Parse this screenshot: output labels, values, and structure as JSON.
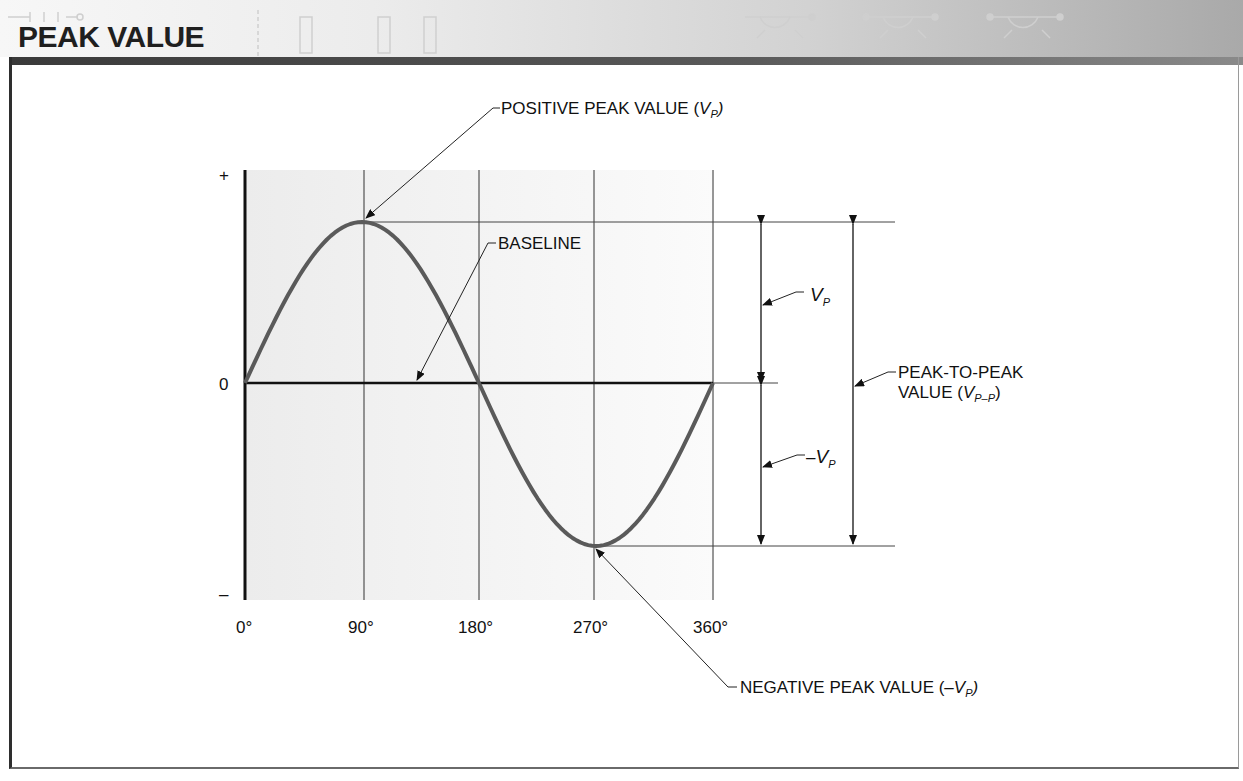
{
  "header": {
    "title": "PEAK VALUE"
  },
  "diagram": {
    "y_axis": {
      "plus_label": "+",
      "zero_label": "0",
      "minus_label": "–"
    },
    "x_axis": {
      "ticks": [
        "0°",
        "90°",
        "180°",
        "270°",
        "360°"
      ]
    },
    "labels": {
      "positive_peak": "POSITIVE PEAK VALUE (",
      "positive_peak_v": "V",
      "positive_peak_sub": "P",
      "positive_peak_close": ")",
      "baseline": "BASELINE",
      "vp_v": "V",
      "vp_sub": "P",
      "neg_vp_prefix": "–",
      "neg_vp_v": "V",
      "neg_vp_sub": "P",
      "p2p_line1": "PEAK-TO-PEAK",
      "p2p_line2": "VALUE (",
      "p2p_v": "V",
      "p2p_sub": "P–P",
      "p2p_close": ")",
      "negative_peak": "NEGATIVE PEAK VALUE (–",
      "negative_peak_v": "V",
      "negative_peak_sub": "P",
      "negative_peak_close": ")"
    },
    "colors": {
      "waveform": "#5a5a5a",
      "lines": "#222222",
      "shading": "#f2f2f2"
    }
  },
  "chart_data": {
    "type": "line",
    "title": "PEAK VALUE",
    "xlabel": "Phase angle",
    "ylabel": "",
    "x": [
      0,
      45,
      90,
      135,
      180,
      225,
      270,
      315,
      360
    ],
    "series": [
      {
        "name": "Sine wave",
        "values": [
          0,
          0.707,
          1,
          0.707,
          0,
          -0.707,
          -1,
          -0.707,
          0
        ]
      }
    ],
    "x_tick_labels": [
      "0°",
      "90°",
      "180°",
      "270°",
      "360°"
    ],
    "y_tick_labels": [
      "+",
      "0",
      "–"
    ],
    "annotations": [
      "POSITIVE PEAK VALUE (VP) at 90°",
      "BASELINE at 0",
      "VP: baseline to positive peak",
      "–VP: baseline to negative peak",
      "PEAK-TO-PEAK VALUE (VP–P): positive peak to negative peak",
      "NEGATIVE PEAK VALUE (–VP) at 270°"
    ],
    "xlim": [
      0,
      360
    ],
    "ylim": [
      -1.35,
      1.35
    ],
    "grid": "vertical lines at 90°, 180°, 270°, 360°"
  }
}
